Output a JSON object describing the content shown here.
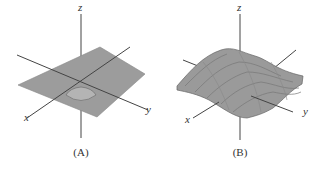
{
  "figure": {
    "panels": [
      {
        "id": "A",
        "caption": "(A)",
        "axes": {
          "x": "x",
          "y": "y",
          "z": "z"
        },
        "description": "Nearly flat surface with a small central dip"
      },
      {
        "id": "B",
        "caption": "(B)",
        "axes": {
          "x": "x",
          "y": "y",
          "z": "z"
        },
        "description": "Wavy oscillating surface"
      }
    ],
    "colors": {
      "surface": "#9a9a9a",
      "surface_dark": "#7a7a7a",
      "axis": "#444444",
      "text": "#333333"
    }
  }
}
